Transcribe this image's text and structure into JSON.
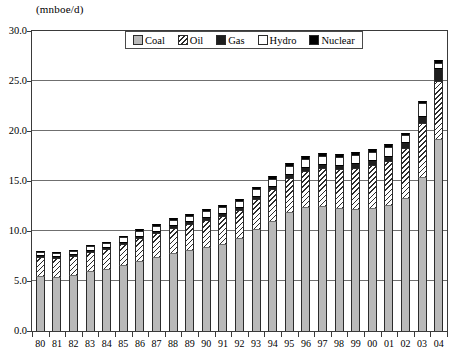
{
  "unit_label": "(mnboe/d)",
  "legend": {
    "items": [
      {
        "label": "Coal",
        "key": "coal",
        "color": "#b9b9b9",
        "swatch": "solid-gray"
      },
      {
        "label": "Oil",
        "key": "oil",
        "color": "#2b2b2b",
        "swatch": "diagonal-hatch"
      },
      {
        "label": "Gas",
        "key": "gas",
        "color": "#1e1e1e",
        "swatch": "solid-dark"
      },
      {
        "label": "Hydro",
        "key": "hydro",
        "color": "#ffffff",
        "swatch": "empty-white"
      },
      {
        "label": "Nuclear",
        "key": "nuclear",
        "color": "#000000",
        "swatch": "solid-black"
      }
    ]
  },
  "chart_data": {
    "type": "bar",
    "subtype": "stacked",
    "title": "",
    "xlabel": "",
    "ylabel": "(mnboe/d)",
    "ylim": [
      0.0,
      30.0
    ],
    "ytick_step": 5.0,
    "yticks": [
      "0.0",
      "5.0",
      "10.0",
      "15.0",
      "20.0",
      "25.0",
      "30.0"
    ],
    "ytick_values": [
      0.0,
      5.0,
      10.0,
      15.0,
      20.0,
      25.0,
      30.0
    ],
    "grid": "horizontal",
    "legend_position": "top-center-inside",
    "categories": [
      "80",
      "81",
      "82",
      "83",
      "84",
      "85",
      "86",
      "87",
      "88",
      "89",
      "90",
      "91",
      "92",
      "93",
      "94",
      "95",
      "96",
      "97",
      "98",
      "99",
      "00",
      "01",
      "02",
      "03",
      "04"
    ],
    "series": [
      {
        "name": "Coal",
        "values": [
          5.5,
          5.4,
          5.6,
          6.0,
          6.2,
          6.6,
          7.0,
          7.4,
          7.8,
          8.1,
          8.4,
          8.7,
          9.3,
          10.2,
          11.0,
          11.9,
          12.4,
          12.5,
          12.3,
          12.2,
          12.3,
          12.6,
          13.3,
          15.4,
          19.2
        ]
      },
      {
        "name": "Oil",
        "values": [
          1.9,
          1.9,
          1.9,
          1.9,
          2.0,
          2.1,
          2.3,
          2.4,
          2.5,
          2.6,
          2.7,
          2.8,
          2.8,
          3.0,
          3.2,
          3.4,
          3.6,
          3.8,
          3.9,
          4.1,
          4.3,
          4.4,
          5.0,
          5.4,
          5.8
        ]
      },
      {
        "name": "Gas",
        "values": [
          0.2,
          0.2,
          0.2,
          0.2,
          0.2,
          0.2,
          0.2,
          0.2,
          0.3,
          0.3,
          0.3,
          0.3,
          0.3,
          0.3,
          0.3,
          0.4,
          0.4,
          0.4,
          0.4,
          0.5,
          0.5,
          0.5,
          0.6,
          0.7,
          1.3
        ]
      },
      {
        "name": "Hydro",
        "values": [
          0.3,
          0.3,
          0.3,
          0.4,
          0.4,
          0.5,
          0.5,
          0.5,
          0.5,
          0.5,
          0.6,
          0.6,
          0.6,
          0.7,
          0.7,
          0.8,
          0.8,
          0.8,
          0.8,
          0.8,
          0.8,
          0.9,
          0.7,
          1.3,
          0.5
        ]
      },
      {
        "name": "Nuclear",
        "values": [
          0.1,
          0.1,
          0.1,
          0.1,
          0.1,
          0.1,
          0.2,
          0.2,
          0.2,
          0.2,
          0.2,
          0.2,
          0.2,
          0.2,
          0.3,
          0.3,
          0.3,
          0.3,
          0.3,
          0.3,
          0.3,
          0.3,
          0.2,
          0.2,
          0.3
        ]
      }
    ],
    "totals": [
      8.0,
      7.9,
      8.1,
      8.6,
      8.9,
      9.5,
      10.2,
      10.7,
      11.3,
      11.7,
      12.2,
      12.6,
      13.2,
      14.4,
      15.5,
      16.8,
      17.5,
      17.8,
      17.7,
      17.9,
      18.2,
      18.7,
      19.8,
      23.0,
      27.1
    ]
  }
}
